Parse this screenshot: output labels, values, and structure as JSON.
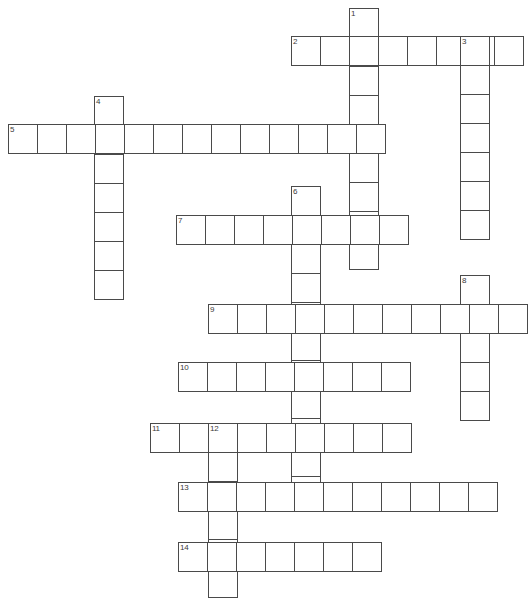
{
  "puzzle": {
    "type": "crossword-grid",
    "title": "",
    "canvas": {
      "width": 527,
      "height": 611,
      "background": "#ffffff"
    },
    "cell": {
      "size": 29,
      "border_color": "#4a4a4a",
      "fill": "#ffffff",
      "border_width": 1
    },
    "number_style": {
      "font_size": 8,
      "color": "#3a3a3a"
    },
    "entries": [
      {
        "number": "1",
        "direction": "down",
        "length": 9,
        "x": 349,
        "y": 8,
        "label_x": 351,
        "label_y": 10
      },
      {
        "number": "2",
        "direction": "across",
        "length": 8,
        "x": 291,
        "y": 36,
        "label_x": 293,
        "label_y": 38
      },
      {
        "number": "3",
        "direction": "down",
        "length": 7,
        "x": 460,
        "y": 36,
        "label_x": 462,
        "label_y": 38
      },
      {
        "number": "4",
        "direction": "down",
        "length": 7,
        "x": 94,
        "y": 96,
        "label_x": 96,
        "label_y": 98
      },
      {
        "number": "5",
        "direction": "across",
        "length": 13,
        "x": 8,
        "y": 124,
        "label_x": 10,
        "label_y": 126
      },
      {
        "number": "6",
        "direction": "down",
        "length": 11,
        "x": 291,
        "y": 186,
        "label_x": 293,
        "label_y": 188
      },
      {
        "number": "7",
        "direction": "across",
        "length": 8,
        "x": 176,
        "y": 215,
        "label_x": 178,
        "label_y": 217
      },
      {
        "number": "8",
        "direction": "down",
        "length": 5,
        "x": 460,
        "y": 275,
        "label_x": 462,
        "label_y": 277
      },
      {
        "number": "9",
        "direction": "across",
        "length": 11,
        "x": 208,
        "y": 304,
        "label_x": 210,
        "label_y": 306
      },
      {
        "number": "10",
        "direction": "across",
        "length": 8,
        "x": 178,
        "y": 362,
        "label_x": 180,
        "label_y": 364
      },
      {
        "number": "11",
        "direction": "across",
        "length": 9,
        "x": 150,
        "y": 423,
        "label_x": 152,
        "label_y": 425
      },
      {
        "number": "12",
        "direction": "down",
        "length": 6,
        "x": 208,
        "y": 423,
        "label_x": 210,
        "label_y": 425
      },
      {
        "number": "13",
        "direction": "across",
        "length": 11,
        "x": 178,
        "y": 482,
        "label_x": 180,
        "label_y": 484
      },
      {
        "number": "14",
        "direction": "across",
        "length": 7,
        "x": 178,
        "y": 542,
        "label_x": 180,
        "label_y": 544
      }
    ]
  }
}
